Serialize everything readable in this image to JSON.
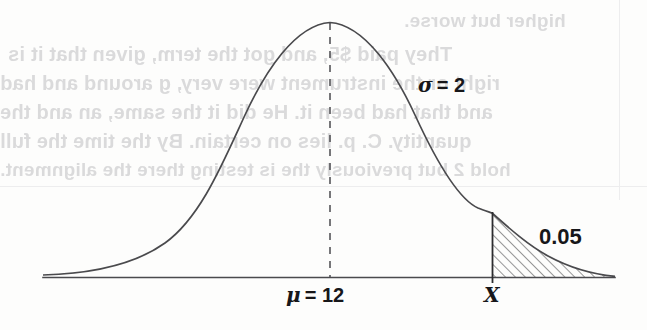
{
  "figure": {
    "kind": "normal-distribution-curve",
    "width": 647,
    "height": 330,
    "background_color": "#fdfdfc",
    "ink_color": "#4a4a4d",
    "text_color": "#17171a"
  },
  "labels": {
    "sigma": "σ = 2",
    "sigma_symbol": "σ",
    "sigma_value": "2",
    "mu": "μ = 12",
    "mu_symbol": "μ",
    "mu_value": "12",
    "x_marker": "X",
    "tail_area": "0.05"
  },
  "ghost_text": {
    "note": "mirrored show-through text from reverse of scanned page",
    "color": "#d9d9da",
    "lines": [
      {
        "text": "higher but worse.",
        "left": 404,
        "top": 10,
        "size": 19
      },
      {
        "text": "They paid $5, and got the term, given that it is",
        "left": 8,
        "top": 43,
        "size": 20
      },
      {
        "text": "right or the instrument were very, g around and had",
        "left": 0,
        "top": 72,
        "size": 20
      },
      {
        "text": "and that had been it. He did it the same, an and the",
        "left": 0,
        "top": 101,
        "size": 20
      },
      {
        "text": "quantity. C. p. lies on certain. By the time the full",
        "left": 0,
        "top": 130,
        "size": 20
      },
      {
        "text": "hold 2 but previously the is testing there the alignment.",
        "left": 0,
        "top": 159,
        "size": 19
      }
    ],
    "edges": [
      {
        "left": 619,
        "top": 0,
        "width": 1,
        "height": 200
      },
      {
        "left": 0,
        "top": 186,
        "width": 647,
        "height": 1
      }
    ]
  },
  "chart_data": {
    "type": "line",
    "title": "",
    "xlabel": "",
    "ylabel": "",
    "distribution": "normal",
    "mean": 12,
    "std_dev": 2,
    "shaded_tail": {
      "side": "right",
      "area": 0.05,
      "boundary_label": "X",
      "hatched": true,
      "hatch_angle_deg": 45
    },
    "annotations": [
      {
        "text": "σ = 2",
        "kind": "std-dev-label"
      },
      {
        "text": "μ = 12",
        "kind": "mean-label",
        "at_axis": true
      },
      {
        "text": "X",
        "kind": "axis-tick-label"
      },
      {
        "text": "0.05",
        "kind": "area-label"
      }
    ],
    "axis": {
      "show_baseline": true,
      "show_frame": false,
      "grid": false
    },
    "legend": {
      "show": false
    }
  },
  "geometry": {
    "baseline_y": 277,
    "baseline_x_start": 43,
    "baseline_x_end": 615,
    "peak_x": 330,
    "peak_y": 22,
    "x_marker_x": 492,
    "curve_y_at_x_marker": 213
  }
}
